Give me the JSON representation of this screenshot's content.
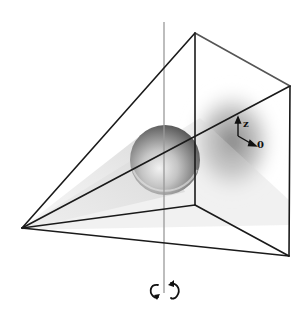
{
  "figure": {
    "apex": [
      22,
      228
    ],
    "box_corners": {
      "top_back": [
        195,
        33
      ],
      "top_right": [
        290,
        86
      ],
      "bottom_back": [
        195,
        205
      ],
      "bottom_right": [
        289,
        256
      ]
    },
    "rotation_axis": {
      "x": 164,
      "y_top": 22,
      "y_bottom": 293,
      "color": "#9a9a9a"
    },
    "sphere": {
      "cx": 165,
      "cy": 160,
      "r": 35
    },
    "shadow_blob": {
      "cx": 232,
      "cy": 142,
      "rx": 48,
      "ry": 58
    },
    "line_color": "#1a1a1a",
    "beam_color": "#cfcfcf"
  },
  "labels": {
    "z_axis": "z",
    "theta_axis": "0"
  },
  "icons": {
    "rotate_ccw": "rotate-counterclockwise-arrow",
    "rotate_cw": "rotate-clockwise-arrow"
  }
}
